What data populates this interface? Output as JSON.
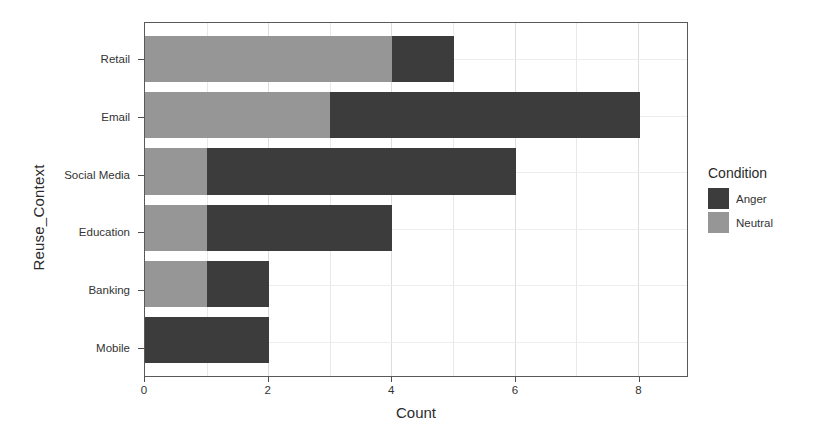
{
  "chart_data": {
    "type": "bar",
    "orientation": "horizontal",
    "stacked": true,
    "title": "",
    "xlabel": "Count",
    "ylabel": "Reuse_Context",
    "categories": [
      "Retail",
      "Email",
      "Social Media",
      "Education",
      "Banking",
      "Mobile"
    ],
    "series": [
      {
        "name": "Neutral",
        "color": "#969696",
        "values": [
          4,
          3,
          1,
          1,
          1,
          0
        ]
      },
      {
        "name": "Anger",
        "color": "#3c3c3c",
        "values": [
          1,
          5,
          5,
          3,
          1,
          2
        ]
      }
    ],
    "stack_order": [
      "Neutral",
      "Anger"
    ],
    "totals": [
      5,
      8,
      6,
      4,
      2,
      2
    ],
    "xlim": [
      0,
      8.8
    ],
    "xticks": [
      0,
      2,
      4,
      6,
      8
    ],
    "xtick_labels": [
      "0",
      "2",
      "4",
      "6",
      "8"
    ],
    "minor_xticks": [
      1,
      3,
      5,
      7
    ],
    "grid": true,
    "legend": {
      "title": "Condition",
      "position": "right",
      "entries": [
        {
          "label": "Anger",
          "color": "#3c3c3c"
        },
        {
          "label": "Neutral",
          "color": "#969696"
        }
      ]
    }
  },
  "panel": {
    "background": "#ffffff",
    "border_color": "#595959",
    "gridline_color": "#dddddd"
  }
}
